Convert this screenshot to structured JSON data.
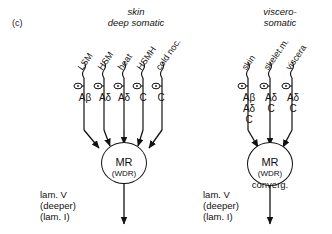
{
  "figure": {
    "panel_id": "(c)",
    "width": 332,
    "height": 234,
    "ink_color": "#111111",
    "background": "#ffffff"
  },
  "left_panel": {
    "title_line1": "skin",
    "title_line2": "deep somatic",
    "inputs": [
      {
        "label": "LSM",
        "fiber": "Aβ",
        "fiber_extra": ""
      },
      {
        "label": "HSM",
        "fiber": "Aδ",
        "fiber_extra": ""
      },
      {
        "label": "heat",
        "fiber": "Aδ",
        "fiber_extra": ""
      },
      {
        "label": "HSMH",
        "fiber": "C",
        "fiber_extra": ""
      },
      {
        "label": "cold noc.",
        "fiber": "C",
        "fiber_extra": ""
      }
    ],
    "soma": {
      "name": "MR",
      "subtype": "(WDR)",
      "extra": ""
    },
    "lamina_line1": "lam. V",
    "lamina_line2": "(deeper)",
    "lamina_line3": "(lam. I)"
  },
  "right_panel": {
    "title_line1": "viscero-",
    "title_line2": "somatic",
    "inputs": [
      {
        "label": "skin",
        "fibers": [
          "Aβ",
          "Aδ",
          "C"
        ]
      },
      {
        "label": "skelet.m.",
        "fibers": [
          "Aδ",
          "C"
        ]
      },
      {
        "label": "viscera",
        "fibers": [
          "Aδ",
          "C"
        ]
      }
    ],
    "soma": {
      "name": "MR",
      "subtype": "(WDR)",
      "extra": "converg."
    },
    "lamina_line1": "lam. V",
    "lamina_line2": "(deeper)",
    "lamina_line3": "(lam. I)"
  }
}
